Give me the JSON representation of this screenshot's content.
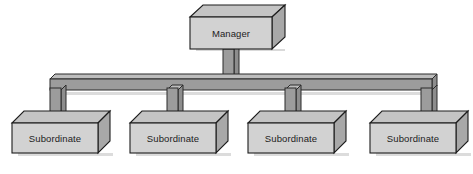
{
  "diagram": {
    "type": "organization-chart",
    "background_color": "#ffffff",
    "style": {
      "box_face_color": "#d2d2d2",
      "box_top_color": "#c0c0c0",
      "box_side_color": "#a8a8a8",
      "box_outline_color": "#1c1c1c",
      "connector_face_color": "#9c9c9c",
      "connector_top_color": "#b4b4b4",
      "connector_outline_color": "#2a2a2a",
      "shadow_color": "#c8c8c8",
      "text_color": "#1c1c1c"
    },
    "manager": {
      "label": "Manager",
      "x": 190,
      "y": 12,
      "width": 82,
      "height": 32,
      "depth": 13
    },
    "subordinates": [
      {
        "label": "Subordinate",
        "x": 12,
        "y": 118,
        "width": 86,
        "height": 30,
        "depth": 12
      },
      {
        "label": "Subordinate",
        "x": 130,
        "y": 118,
        "width": 86,
        "height": 30,
        "depth": 12
      },
      {
        "label": "Subordinate",
        "x": 248,
        "y": 118,
        "width": 86,
        "height": 30,
        "depth": 12
      },
      {
        "label": "Subordinate",
        "x": 370,
        "y": 118,
        "width": 86,
        "height": 30,
        "depth": 12
      }
    ],
    "connectors": {
      "bus_bar": {
        "x_start": 50,
        "x_end": 432,
        "y": 78,
        "thickness": 11
      },
      "manager_stem": {
        "x": 228,
        "y_top": 48,
        "y_bottom": 80,
        "thickness": 11
      },
      "drops": [
        {
          "x": 54,
          "y_top": 86,
          "y_bottom": 116,
          "thickness": 11
        },
        {
          "x": 172,
          "y_top": 86,
          "y_bottom": 116,
          "thickness": 11
        },
        {
          "x": 290,
          "y_top": 86,
          "y_bottom": 116,
          "thickness": 11
        },
        {
          "x": 412,
          "y_top": 86,
          "y_bottom": 116,
          "thickness": 11
        }
      ]
    }
  }
}
